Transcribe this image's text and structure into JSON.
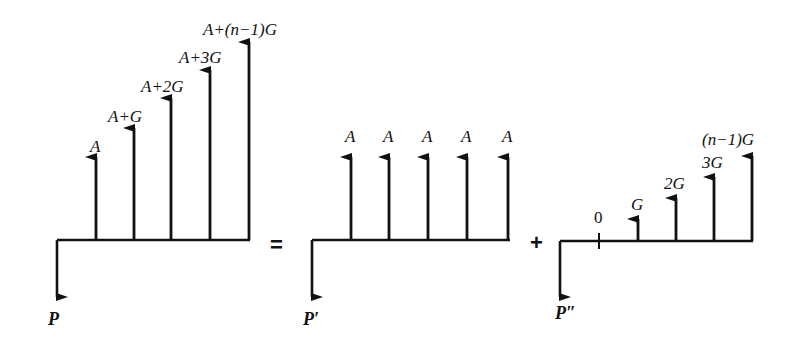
{
  "diagram": {
    "equation_operators": {
      "equals": "=",
      "plus": "+"
    },
    "gradient_series": {
      "present_value_label": "P",
      "cash_flow_labels": [
        "A",
        "A+G",
        "A+2G",
        "A+3G",
        "A+(n−1)G"
      ]
    },
    "uniform_series": {
      "present_value_label": "P′",
      "cash_flow_labels": [
        "A",
        "A",
        "A",
        "A",
        "A"
      ]
    },
    "pure_gradient_series": {
      "present_value_label": "P″",
      "zero_label": "0",
      "cash_flow_labels": [
        "G",
        "2G",
        "3G",
        "(n−1)G"
      ]
    }
  },
  "colors": {
    "ink": "#111111",
    "background": "#ffffff"
  }
}
